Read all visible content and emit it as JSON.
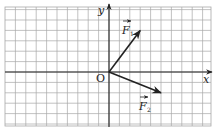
{
  "diagram": {
    "type": "vector-grid",
    "grid": {
      "spacing_px": 10.4,
      "color": "#a8a8a8",
      "cols": 20,
      "rows": 11
    },
    "axes": {
      "x_label": "x",
      "y_label": "y",
      "origin_label": "O",
      "color": "#222222"
    },
    "vectors": [
      {
        "name": "F1",
        "label": "F",
        "subscript": "1",
        "dx": 3,
        "dy": 4,
        "color": "#222222"
      },
      {
        "name": "F2",
        "label": "F",
        "subscript": "2",
        "dx": 5,
        "dy": -2,
        "color": "#222222"
      }
    ]
  }
}
